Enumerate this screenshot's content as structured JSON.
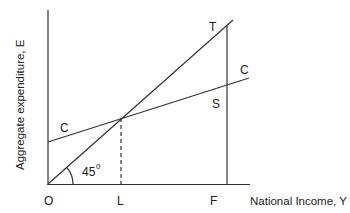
{
  "diagram": {
    "y_axis_label": "Aggregate expenditure, E",
    "x_axis_label": "National Income, Y",
    "origin_label": "O",
    "x_ticks": [
      "L",
      "F"
    ],
    "lines": {
      "forty_five_degree": {
        "label": "T",
        "angle_label": "45",
        "angle_sup": "0"
      },
      "consumption": {
        "label_left": "C",
        "label_right": "C"
      },
      "gap_label": "S"
    },
    "colors": {
      "line": "#333333",
      "text": "#222222",
      "background": "#ffffff"
    }
  }
}
